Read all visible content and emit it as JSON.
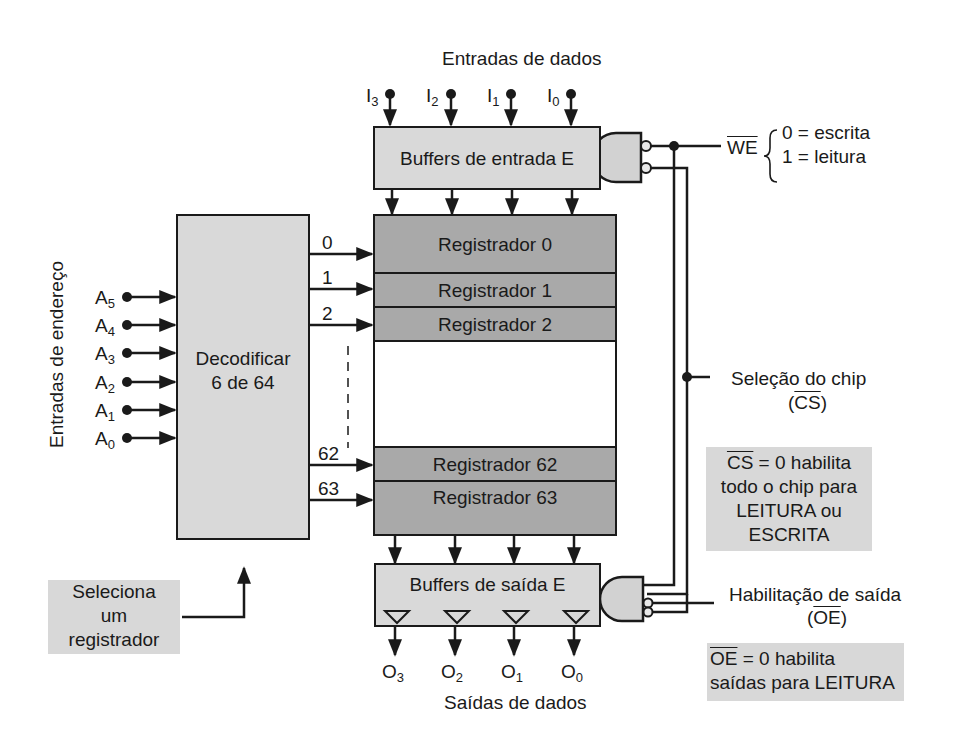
{
  "data_inputs": {
    "label": "Entradas de dados",
    "pins": [
      {
        "name": "I",
        "sub": "3"
      },
      {
        "name": "I",
        "sub": "2"
      },
      {
        "name": "I",
        "sub": "1"
      },
      {
        "name": "I",
        "sub": "0"
      }
    ]
  },
  "input_buffers": {
    "label": "Buffers de entrada E"
  },
  "write_enable": {
    "signal": "WE",
    "state_0": "0 = escrita",
    "state_1": "1 = leitura"
  },
  "address_inputs": {
    "label": "Entradas de endereço",
    "pins": [
      {
        "name": "A",
        "sub": "5"
      },
      {
        "name": "A",
        "sub": "4"
      },
      {
        "name": "A",
        "sub": "3"
      },
      {
        "name": "A",
        "sub": "2"
      },
      {
        "name": "A",
        "sub": "1"
      },
      {
        "name": "A",
        "sub": "0"
      }
    ]
  },
  "decoder": {
    "line1": "Decodificar",
    "line2": "6 de 64"
  },
  "decoder_outputs": [
    "0",
    "1",
    "2",
    "62",
    "63"
  ],
  "registers": [
    "Registrador 0",
    "Registrador 1",
    "Registrador 2",
    "Registrador 62",
    "Registrador 63"
  ],
  "chip_select": {
    "label": "Seleção do chip",
    "signal": "CS"
  },
  "cs_note": {
    "signal": "CS",
    "line1_rest": " = 0 habilita",
    "line2": "todo o chip para",
    "line3": "LEITURA ou",
    "line4": "ESCRITA"
  },
  "output_buffers": {
    "label": "Buffers de saída E"
  },
  "output_enable": {
    "label": "Habilitação de saída",
    "signal": "OE"
  },
  "oe_note": {
    "signal": "OE",
    "line1_rest": " = 0 habilita",
    "line2": "saídas para LEITURA"
  },
  "data_outputs": {
    "label": "Saídas de dados",
    "pins": [
      {
        "name": "O",
        "sub": "3"
      },
      {
        "name": "O",
        "sub": "2"
      },
      {
        "name": "O",
        "sub": "1"
      },
      {
        "name": "O",
        "sub": "0"
      }
    ]
  },
  "select_note": {
    "line1": "Seleciona",
    "line2": "um",
    "line3": "registrador"
  },
  "colors": {
    "light_block": "#d9d9d9",
    "register": "#a9a9a9",
    "note_bg": "#d8d8d8",
    "line": "#1a1a1a"
  }
}
